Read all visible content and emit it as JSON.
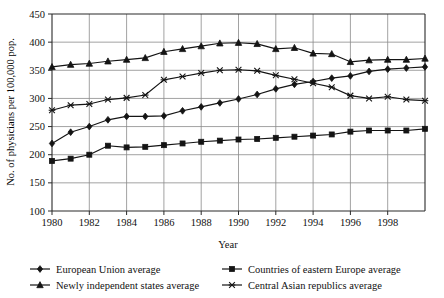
{
  "chart_data": {
    "type": "line",
    "title": "",
    "xlabel": "Year",
    "ylabel": "No. of physicians per 100,000 pop.",
    "xlim": [
      1980,
      2000
    ],
    "ylim": [
      100,
      450
    ],
    "xticks": [
      1980,
      1982,
      1984,
      1986,
      1988,
      1990,
      1992,
      1994,
      1996,
      1998
    ],
    "xtick_labels": [
      "1980",
      "1982",
      "1984",
      "1986",
      "1988",
      "1990",
      "1992",
      "1994",
      "1996",
      "1998"
    ],
    "yticks": [
      100,
      150,
      200,
      250,
      300,
      350,
      400,
      450
    ],
    "ytick_labels": [
      "100",
      "150",
      "200",
      "250",
      "300",
      "350",
      "400",
      "450"
    ],
    "grid": true,
    "legend_position": "below",
    "x": [
      1980,
      1981,
      1982,
      1983,
      1984,
      1985,
      1986,
      1987,
      1988,
      1989,
      1990,
      1991,
      1992,
      1993,
      1994,
      1995,
      1996,
      1997,
      1998,
      1999,
      2000
    ],
    "series": [
      {
        "name": "European Union average",
        "marker": "diamond",
        "color": "#141414",
        "values": [
          220,
          240,
          250,
          262,
          268,
          268,
          269,
          278,
          285,
          292,
          299,
          307,
          317,
          325,
          330,
          336,
          340,
          348,
          352,
          354,
          356
        ]
      },
      {
        "name": "Countries of eastern Europe average",
        "marker": "square",
        "color": "#141414",
        "values": [
          189,
          193,
          200,
          216,
          213,
          214,
          217,
          220,
          223,
          225,
          227,
          228,
          230,
          232,
          234,
          236,
          241,
          243,
          243,
          243,
          246
        ]
      },
      {
        "name": "Newly independent states average",
        "marker": "triangle",
        "color": "#141414",
        "values": [
          356,
          360,
          362,
          366,
          369,
          372,
          383,
          388,
          393,
          398,
          399,
          397,
          388,
          390,
          380,
          379,
          365,
          368,
          369,
          369,
          371
        ]
      },
      {
        "name": "Central Asian republics average",
        "marker": "x",
        "color": "#141414",
        "values": [
          279,
          288,
          290,
          298,
          301,
          306,
          333,
          339,
          345,
          350,
          351,
          349,
          341,
          334,
          327,
          320,
          305,
          300,
          303,
          298,
          296
        ]
      }
    ]
  },
  "legend": {
    "entries": [
      {
        "label": "European Union average",
        "marker": "diamond"
      },
      {
        "label": "Countries of eastern Europe average",
        "marker": "square"
      },
      {
        "label": "Newly independent states average",
        "marker": "triangle"
      },
      {
        "label": "Central Asian republics average",
        "marker": "x"
      }
    ]
  }
}
